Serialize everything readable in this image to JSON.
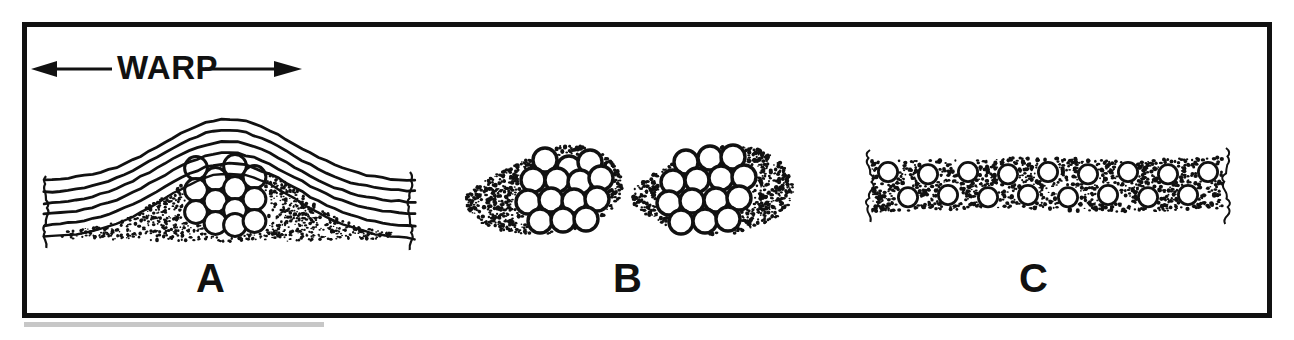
{
  "figure": {
    "frame": {
      "border_color": "#111111",
      "border_width_px": 5,
      "background": "#ffffff"
    },
    "direction_label": {
      "text": "WARP",
      "arrow_left": "left-arrow-icon",
      "arrow_right": "right-arrow-icon",
      "description": "Double-headed horizontal arrow labelled WARP indicating warp direction"
    },
    "panels": [
      {
        "id": "A",
        "label": "A",
        "caption": "A",
        "description": "Crimped warp yarns arching over a stippled matrix pocket containing a hexagonally packed fiber bundle",
        "warp_line_count": 6,
        "fiber_circle_count": 13,
        "fiber_packing": "hexagonal-close-packed",
        "matrix_fill": "stipple",
        "bundle_shape": "compact-hexagonal"
      },
      {
        "id": "B",
        "label": "B",
        "caption": "B",
        "description": "Two separated stippled matrix lobes each containing a hexagonally packed fiber bundle",
        "warp_line_count": 0,
        "fiber_circle_count": 25,
        "fiber_packing": "hexagonal-close-packed",
        "matrix_fill": "stipple",
        "bundle_shape": "two-lobes"
      },
      {
        "id": "C",
        "label": "C",
        "description": "Flat spread stippled band with two staggered rows of dispersed fibers",
        "caption": "C",
        "warp_line_count": 0,
        "fiber_circle_count": 17,
        "fiber_packing": "dispersed-two-row-stagger",
        "matrix_fill": "stipple",
        "bundle_shape": "flat-ribbon"
      }
    ],
    "colors": {
      "ink": "#111111",
      "paper": "#ffffff",
      "stipple": "#111111"
    }
  },
  "chart_data": {
    "type": "diagram",
    "panel_labels": [
      "A",
      "B",
      "C"
    ],
    "annotations": [
      "WARP"
    ],
    "series": [
      {
        "name": "A fibers",
        "values": [
          13
        ]
      },
      {
        "name": "B fibers",
        "values": [
          25
        ]
      },
      {
        "name": "C fibers",
        "values": [
          17
        ]
      }
    ]
  }
}
